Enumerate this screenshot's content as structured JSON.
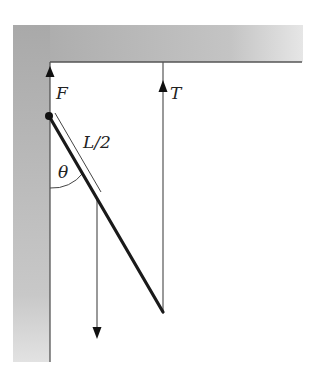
{
  "diagram": {
    "labels": {
      "F": "F",
      "T": "T",
      "half_length": "L/2",
      "angle": "θ"
    },
    "colors": {
      "wall_fill": "#b8b8b8",
      "wall_edge": "#555555",
      "rod": "#1a1a1a",
      "force_line": "#555555",
      "background": "#ffffff"
    },
    "elements": {
      "wall": "vertical wall on left",
      "ceiling": "horizontal ceiling on top",
      "rod": "uniform rod hinged at wall, lower end held by string",
      "hinge": "pivot point on wall",
      "force_F": "upward hinge force at wall",
      "tension_T": "upward string tension at rod end",
      "weight": "downward weight at rod midpoint"
    }
  }
}
